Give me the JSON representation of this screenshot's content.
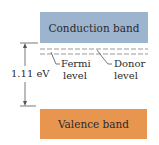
{
  "diagram": {
    "conduction_band": {
      "label": "Conduction band",
      "color": "#9db4cf"
    },
    "valence_band": {
      "label": "Valence band",
      "color": "#e8954f"
    },
    "gap": {
      "label": "1.11 eV"
    },
    "fermi_level": {
      "line1": "Fermi",
      "line2": "level"
    },
    "donor_level": {
      "line1": "Donor",
      "line2": "level"
    }
  }
}
